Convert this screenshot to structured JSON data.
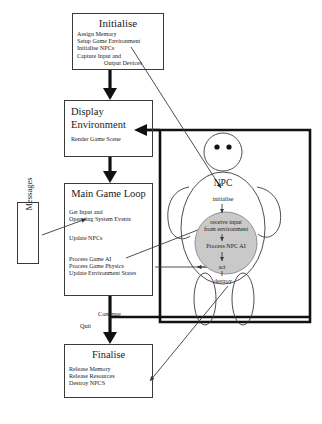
{
  "diagram": {
    "nodes": {
      "initialise": {
        "title": "Initialise",
        "lines": [
          "Assign Memory",
          "Setup Game Environment",
          "Initialise NPCs",
          "Capture Input and",
          "Output Devices"
        ]
      },
      "display_environment": {
        "title_line1": "Display",
        "title_line2": "Environment",
        "sub": "Render Game Scene"
      },
      "main_game_loop": {
        "title": "Main Game Loop",
        "group1": [
          "Get Input and",
          "Operating System Events"
        ],
        "group2": [
          "Update NPCs"
        ],
        "group3": [
          "Process Game AI",
          "Process Game Physics",
          "Update Environment States"
        ]
      },
      "messages": {
        "label": "Messages"
      },
      "finalise": {
        "title": "Finalise",
        "lines": [
          "Release Memory",
          "Release Resources",
          "Destroy NPCS"
        ]
      },
      "npc": {
        "name": "NPC",
        "initialise": "initialise",
        "receive_input": [
          "receive input",
          "from environment"
        ],
        "process": "Process NPC AI",
        "act": "act",
        "destroy": "destroy"
      }
    },
    "edge_labels": {
      "continue": "Continue",
      "quit": "Quit"
    },
    "colors": {
      "stroke": "#3a3a3a",
      "thick_stroke": "#111111",
      "inner_circle_fill": "#c9c9c9",
      "background": "#ffffff"
    }
  }
}
